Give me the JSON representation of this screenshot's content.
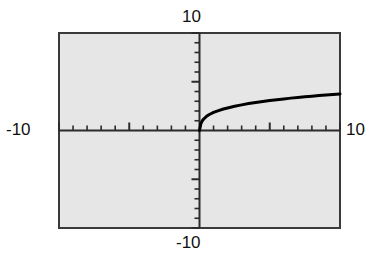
{
  "chart_data": {
    "type": "line",
    "title": "",
    "subtitle": "",
    "xlabel": "",
    "ylabel": "",
    "xlim": [
      -10,
      10
    ],
    "ylim": [
      -10,
      10
    ],
    "grid": false,
    "legend": null,
    "axis_labels": {
      "top": "10",
      "right": "10",
      "left": "-10",
      "bottom": "-10"
    },
    "tick_interval": 1,
    "major_tick_interval": 5,
    "background_color": "#e6e6e6",
    "frame_color": "#3a3a3a",
    "curve_color": "#000000",
    "series": [
      {
        "name": "curve",
        "domain": [
          0,
          10
        ],
        "x": [
          0.0,
          0.1,
          0.2,
          0.3,
          0.5,
          0.7,
          1.0,
          1.3,
          1.7,
          2.0,
          2.5,
          3.0,
          3.5,
          4.0,
          4.5,
          5.0,
          5.5,
          6.0,
          6.5,
          7.0,
          7.5,
          8.0,
          8.5,
          9.0,
          9.5,
          10.0
        ],
        "y": [
          0.0,
          0.72,
          1.0,
          1.18,
          1.45,
          1.64,
          1.85,
          2.02,
          2.2,
          2.31,
          2.49,
          2.63,
          2.76,
          2.88,
          2.98,
          3.08,
          3.16,
          3.24,
          3.32,
          3.39,
          3.46,
          3.52,
          3.58,
          3.64,
          3.69,
          3.75
        ]
      }
    ]
  },
  "figure": {
    "caption": ""
  }
}
